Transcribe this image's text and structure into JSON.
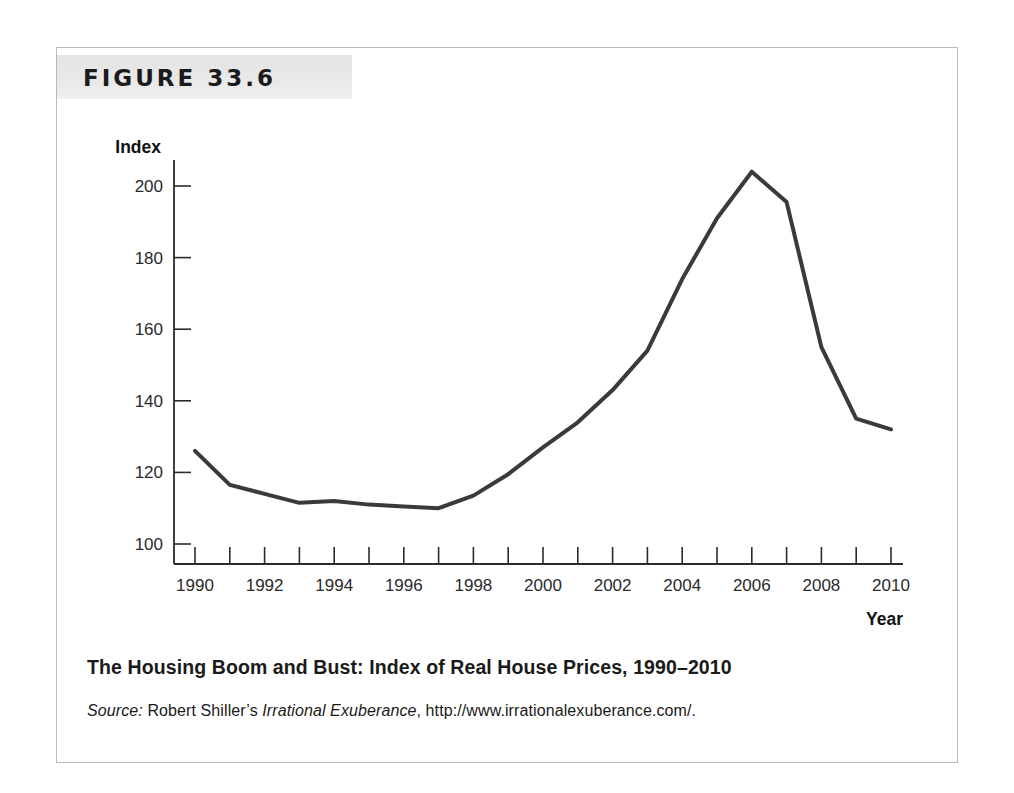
{
  "figure": {
    "number_label": "FIGURE 33.6",
    "caption": "The Housing Boom and Bust: Index of Real House Prices, 1990–2010",
    "source_prefix": "Source:",
    "source_author": "Robert Shiller’s",
    "source_work": "Irrational Exuberance",
    "source_comma": ",",
    "source_url": "http://www.irrationalexuberance.com/.",
    "border_color": "#b9b9b9",
    "banner_color": "#e7e7e7"
  },
  "chart_data": {
    "type": "line",
    "title": "The Housing Boom and Bust: Index of Real House Prices, 1990–2010",
    "xlabel": "Year",
    "ylabel": "Index",
    "xlim": [
      1990,
      2010
    ],
    "ylim": [
      93,
      208
    ],
    "grid": false,
    "legend": "none",
    "line_color": "#3a3a3a",
    "line_width": 4,
    "x": [
      1990,
      1991,
      1992,
      1993,
      1994,
      1995,
      1996,
      1997,
      1998,
      1999,
      2000,
      2001,
      2002,
      2003,
      2004,
      2005,
      2006,
      2007,
      2008,
      2009,
      2010
    ],
    "values": [
      126,
      116.5,
      114,
      111.5,
      112,
      111,
      110.5,
      110,
      113.5,
      119.5,
      127,
      134,
      143,
      154,
      174,
      191,
      204,
      195.5,
      155,
      135,
      132
    ],
    "series": [
      {
        "name": "Index of Real House Prices",
        "values": [
          126,
          116.5,
          114,
          111.5,
          112,
          111,
          110.5,
          110,
          113.5,
          119.5,
          127,
          134,
          143,
          154,
          174,
          191,
          204,
          195.5,
          155,
          135,
          132
        ]
      }
    ],
    "y_ticks": [
      100,
      120,
      140,
      160,
      180,
      200
    ],
    "y_tick_labels": [
      "100",
      "120",
      "140",
      "160",
      "180",
      "200"
    ],
    "x_ticks": [
      1990,
      1991,
      1992,
      1993,
      1994,
      1995,
      1996,
      1997,
      1998,
      1999,
      2000,
      2001,
      2002,
      2003,
      2004,
      2005,
      2006,
      2007,
      2008,
      2009,
      2010
    ],
    "x_tick_labels_shown": [
      "1990",
      "1992",
      "1994",
      "1996",
      "1998",
      "2000",
      "2002",
      "2004",
      "2006",
      "2008",
      "2010"
    ],
    "annotations": []
  }
}
